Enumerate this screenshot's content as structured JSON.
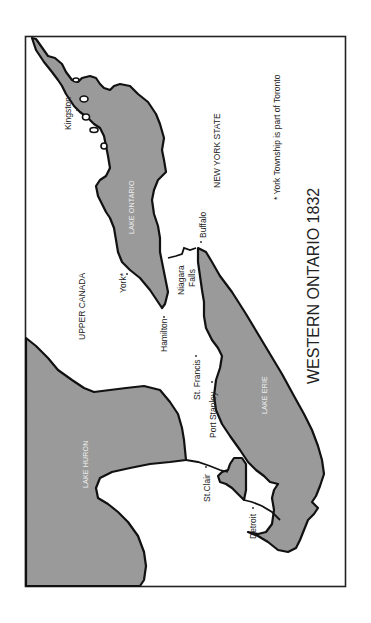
{
  "map": {
    "title": "WESTERN ONTARIO 1832",
    "footnote": "* York Township is part of Toronto",
    "orientation": "rotated 90° counter-clockwise (north points left)",
    "colors": {
      "water": "#9a9a9a",
      "land": "#ffffff",
      "coastline": "#111111",
      "text": "#222222",
      "lake_label": "#eeeeee"
    },
    "regions": {
      "upper_canada": "UPPER CANADA",
      "new_york_state": "NEW YORK STATE"
    },
    "lakes": {
      "ontario": "LAKE ONTARIO",
      "erie": "LAKE ERIE",
      "huron": "LAKE HURON"
    },
    "places": {
      "kingston": "Kingston",
      "york": "York*",
      "hamilton": "Hamilton",
      "niagara_1": "Niagara",
      "niagara_2": "Falls",
      "buffalo": "Buffalo",
      "st_francis": "St. Francis",
      "port_stanley": "Port Stanley",
      "st_clair": "St.Clair",
      "detroit": "Detroit"
    }
  }
}
